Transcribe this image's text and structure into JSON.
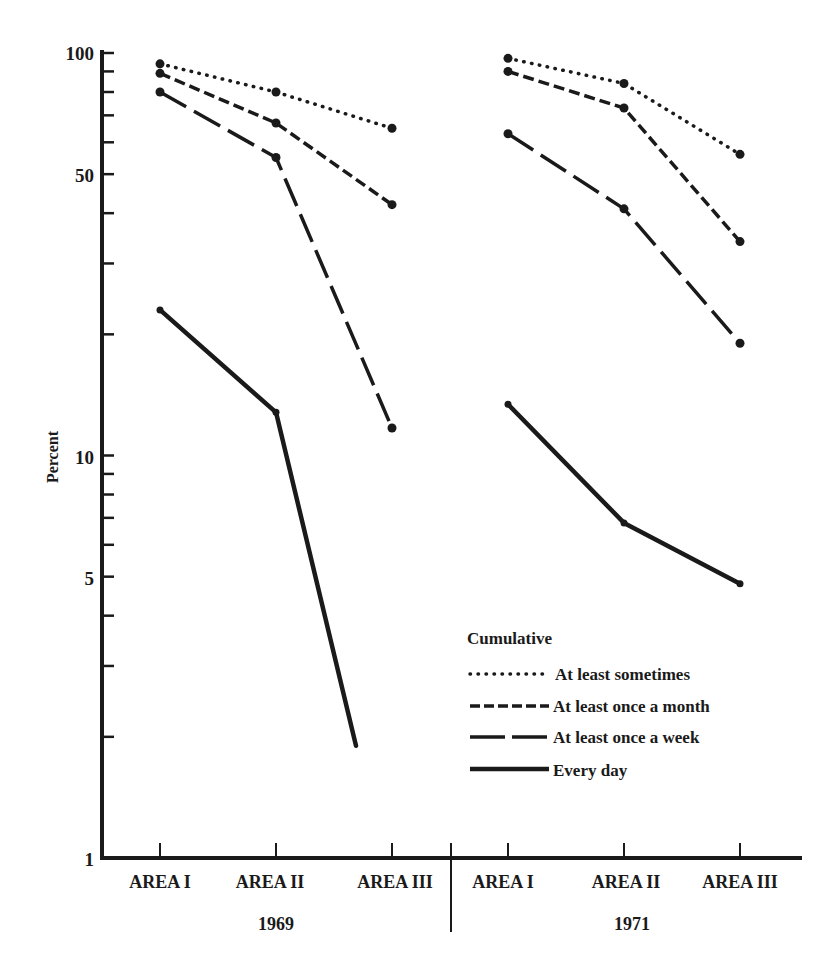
{
  "chart_data": {
    "type": "line",
    "title": "",
    "ylabel": "Percent",
    "xlabel": "",
    "yscale": "log",
    "ylim": [
      1,
      100
    ],
    "y_tick_labels": [
      "100",
      "50",
      "10",
      "5",
      "1"
    ],
    "y_tick_values": [
      100,
      50,
      10,
      5,
      1
    ],
    "y_minor_ticks": [
      90,
      80,
      70,
      60,
      40,
      30,
      20,
      9,
      8,
      7,
      6,
      4,
      3,
      2
    ],
    "grid": false,
    "groups": [
      {
        "label": "1969",
        "categories": [
          "AREA I",
          "AREA II",
          "AREA III"
        ]
      },
      {
        "label": "1971",
        "categories": [
          "AREA I",
          "AREA II",
          "AREA III"
        ]
      }
    ],
    "categories": [
      "AREA I",
      "AREA II",
      "AREA III",
      "AREA I",
      "AREA II",
      "AREA III"
    ],
    "legend_title": "Cumulative",
    "legend_position": "lower right",
    "series": [
      {
        "name": "At least sometimes",
        "style": "dotted",
        "values_1969": [
          94,
          80,
          65
        ],
        "values_1971": [
          97,
          84,
          56
        ]
      },
      {
        "name": "At least once a month",
        "style": "short-dash",
        "values_1969": [
          89,
          67,
          42
        ],
        "values_1971": [
          90,
          73,
          34
        ]
      },
      {
        "name": "At least once a week",
        "style": "long-dash",
        "values_1969": [
          80,
          55,
          11.7
        ],
        "values_1971": [
          63,
          41,
          19
        ]
      },
      {
        "name": "Every day",
        "style": "solid",
        "values_1969": [
          23,
          12.8,
          null
        ],
        "values_1969_tail_end": {
          "between": [
            "AREA II",
            "AREA III"
          ],
          "value": 1.9
        },
        "values_1971": [
          13.4,
          6.8,
          4.8
        ]
      }
    ]
  },
  "axes": {
    "y_label": "Percent",
    "y_ticks": [
      "100",
      "50",
      "10",
      "5",
      "1"
    ],
    "group_1969": {
      "year": "1969",
      "areas": [
        "AREA I",
        "AREA II",
        "AREA III"
      ]
    },
    "group_1971": {
      "year": "1971",
      "areas": [
        "AREA I",
        "AREA II",
        "AREA III"
      ]
    }
  },
  "legend": {
    "title": "Cumulative",
    "items": [
      {
        "label": "At least sometimes"
      },
      {
        "label": "At least once a month"
      },
      {
        "label": "At least once a week"
      },
      {
        "label": "Every day"
      }
    ]
  },
  "colors": {
    "ink": "#1a1a1a",
    "background": "#ffffff"
  }
}
